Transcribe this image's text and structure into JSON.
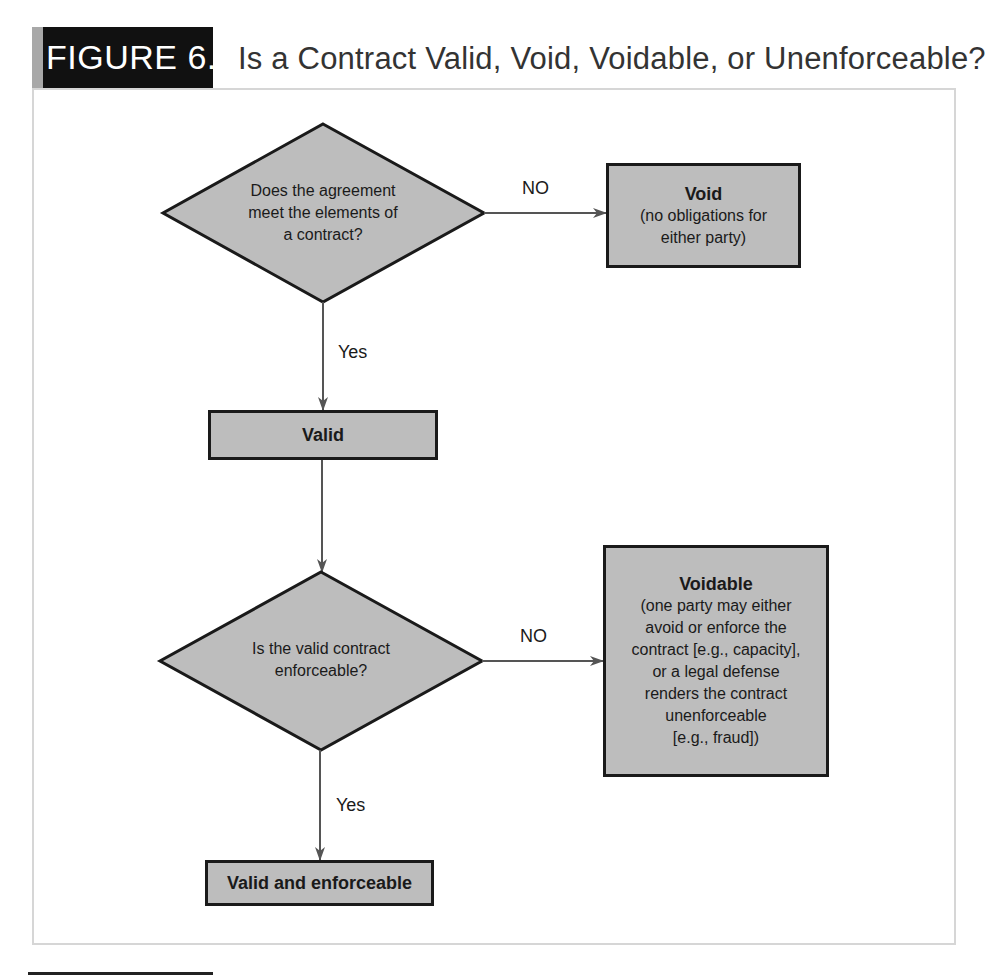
{
  "figure": {
    "label": "FIGURE 6.1",
    "title": "Is a Contract Valid, Void, Voidable, or Unenforceable?"
  },
  "nodes": {
    "question1": {
      "type": "decision",
      "lines": [
        "Does the agreement",
        "meet the elements of",
        "a contract?"
      ]
    },
    "void": {
      "type": "outcome",
      "heading": "Void",
      "lines": [
        "(no obligations for",
        "either party)"
      ]
    },
    "valid": {
      "type": "process",
      "heading": "Valid"
    },
    "question2": {
      "type": "decision",
      "lines": [
        "Is the valid contract",
        "enforceable?"
      ]
    },
    "voidable": {
      "type": "outcome",
      "heading": "Voidable",
      "lines": [
        "(one party may either",
        "avoid or enforce the",
        "contract [e.g., capacity],",
        "or a legal defense",
        "renders the contract",
        "unenforceable",
        "[e.g., fraud])"
      ]
    },
    "valid_enforceable": {
      "type": "outcome",
      "heading": "Valid and enforceable"
    }
  },
  "edges": {
    "q1_no": {
      "from": "question1",
      "to": "void",
      "label": "NO"
    },
    "q1_yes": {
      "from": "question1",
      "to": "valid",
      "label": "Yes"
    },
    "valid_to_q2": {
      "from": "valid",
      "to": "question2",
      "label": ""
    },
    "q2_no": {
      "from": "question2",
      "to": "voidable",
      "label": "NO"
    },
    "q2_yes": {
      "from": "question2",
      "to": "valid_enforceable",
      "label": "Yes"
    }
  },
  "colors": {
    "badge_bg": "#111111",
    "badge_strip": "#a8a8a8",
    "node_fill": "#bdbdbd",
    "node_border": "#1a1a1a",
    "arrow": "#555555",
    "frame_border": "#d6d6d6"
  }
}
